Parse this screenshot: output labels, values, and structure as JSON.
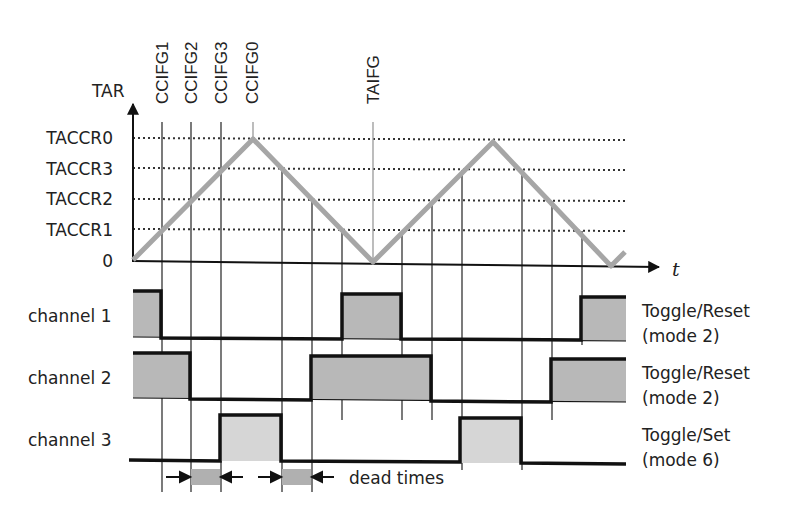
{
  "diagram": {
    "y_axis_label": "TAR",
    "x_axis_label": "t",
    "levels": [
      {
        "label": "TACCR0",
        "y": 138
      },
      {
        "label": "TACCR3",
        "y": 168
      },
      {
        "label": "TACCR2",
        "y": 199
      },
      {
        "label": "TACCR1",
        "y": 229
      },
      {
        "label": "0",
        "y": 260
      }
    ],
    "flags": [
      {
        "label": "CCIFG1",
        "x": 162
      },
      {
        "label": "CCIFG2",
        "x": 191
      },
      {
        "label": "CCIFG3",
        "x": 221
      },
      {
        "label": "CCIFG0",
        "x": 253
      },
      {
        "label": "TAIFG",
        "x": 373
      }
    ],
    "channels": [
      {
        "label": "channel 1",
        "mode_line1": "Toggle/Reset",
        "mode_line2": "(mode 2)"
      },
      {
        "label": "channel 2",
        "mode_line1": "Toggle/Reset",
        "mode_line2": "(mode 2)"
      },
      {
        "label": "channel 3",
        "mode_line1": "Toggle/Set",
        "mode_line2": "(mode 6)"
      }
    ],
    "dead_times_label": "dead times",
    "colors": {
      "waveform": "#a6a6a6",
      "fill_dark": "#b8b8b8",
      "fill_light": "#d6d6d6",
      "line": "#111111"
    }
  }
}
